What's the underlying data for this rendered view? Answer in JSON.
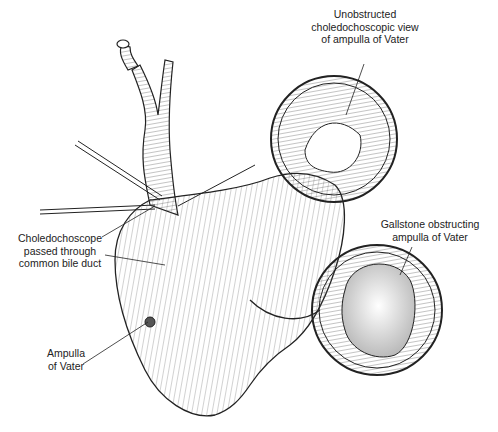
{
  "figure": {
    "type": "medical-illustration",
    "labels": {
      "unobstructed_view": [
        "Unobstructed",
        "choledochoscopic view",
        "of ampulla of Vater"
      ],
      "choledochoscope": [
        "Choledochoscope",
        "passed through",
        "common bile duct"
      ],
      "gallstone": [
        "Gallstone obstructing",
        "ampulla of Vater"
      ],
      "ampulla": [
        "Ampulla",
        "of Vater"
      ]
    },
    "colors": {
      "ink": "#222222",
      "background": "#ffffff"
    }
  }
}
